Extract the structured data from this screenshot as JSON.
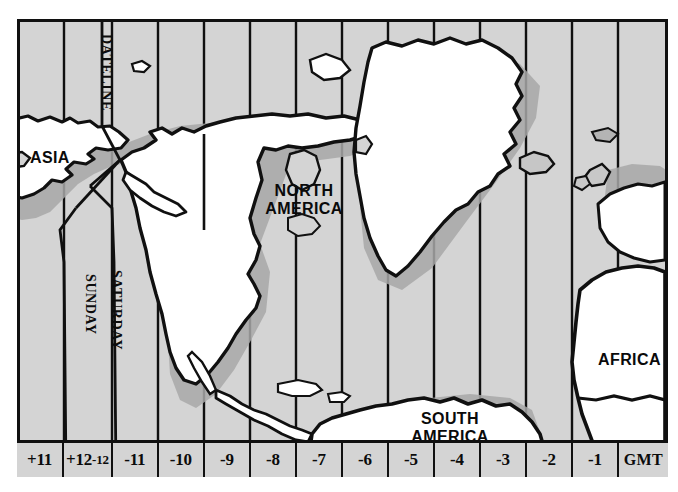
{
  "figure": {
    "kind": "world-time-zone-map",
    "region_shown": "Pacific through Atlantic (Asia to Africa)",
    "ocean_fill": "#d4d4d4",
    "land_fill": "#ffffff",
    "ink": "#101010",
    "frame_border": "#101010"
  },
  "zone_labels": [
    {
      "id": "plus11",
      "text": "+11"
    },
    {
      "id": "plus12-minus12",
      "text_left": "+12",
      "text_right": "-12"
    },
    {
      "id": "minus11",
      "text": "-11"
    },
    {
      "id": "minus10",
      "text": "-10"
    },
    {
      "id": "minus9",
      "text": "-9"
    },
    {
      "id": "minus8",
      "text": "-8"
    },
    {
      "id": "minus7",
      "text": "-7"
    },
    {
      "id": "minus6",
      "text": "-6"
    },
    {
      "id": "minus5",
      "text": "-5"
    },
    {
      "id": "minus4",
      "text": "-4"
    },
    {
      "id": "minus3",
      "text": "-3"
    },
    {
      "id": "minus2",
      "text": "-2"
    },
    {
      "id": "minus1",
      "text": "-1"
    },
    {
      "id": "gmt",
      "text": "GMT"
    }
  ],
  "vertical_labels": {
    "dateline": "DATELINE",
    "saturday": "SATURDAY",
    "sunday": "SUNDAY"
  },
  "continent_labels": {
    "asia": "ASIA",
    "north_america_line1": "NORTH",
    "north_america_line2": "AMERICA",
    "south_america_line1": "SOUTH",
    "south_america_line2": "AMERICA",
    "africa": "AFRICA"
  }
}
